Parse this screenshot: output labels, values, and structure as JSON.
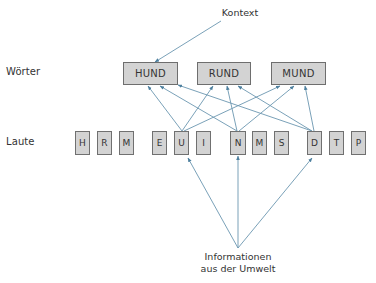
{
  "diagram": {
    "type": "interactive-activation-model",
    "colors": {
      "arrow": "#5b8aa6",
      "box_fill": "#d3d3d3",
      "box_border": "#6e6e6e",
      "text": "#333333"
    },
    "labels": {
      "context": "Kontext",
      "words_row": "Wörter",
      "sounds_row": "Laute",
      "environment_line1": "Informationen",
      "environment_line2": "aus der Umwelt"
    },
    "words": [
      {
        "id": "hund",
        "label": "HUND"
      },
      {
        "id": "rund",
        "label": "RUND"
      },
      {
        "id": "mund",
        "label": "MUND"
      }
    ],
    "sounds": [
      {
        "id": "h",
        "label": "H"
      },
      {
        "id": "r",
        "label": "R"
      },
      {
        "id": "m1",
        "label": "M"
      },
      {
        "id": "e",
        "label": "E"
      },
      {
        "id": "u",
        "label": "U"
      },
      {
        "id": "i",
        "label": "I"
      },
      {
        "id": "n",
        "label": "N"
      },
      {
        "id": "m2",
        "label": "M"
      },
      {
        "id": "s",
        "label": "S"
      },
      {
        "id": "d",
        "label": "D"
      },
      {
        "id": "t",
        "label": "T"
      },
      {
        "id": "p",
        "label": "P"
      }
    ],
    "edges": [
      {
        "from": "Kontext",
        "to": "HUND"
      },
      {
        "from": "U",
        "to": "HUND"
      },
      {
        "from": "U",
        "to": "RUND"
      },
      {
        "from": "U",
        "to": "MUND"
      },
      {
        "from": "N",
        "to": "HUND"
      },
      {
        "from": "N",
        "to": "RUND"
      },
      {
        "from": "N",
        "to": "MUND"
      },
      {
        "from": "D",
        "to": "HUND"
      },
      {
        "from": "D",
        "to": "RUND"
      },
      {
        "from": "D",
        "to": "MUND"
      },
      {
        "from": "Informationen aus der Umwelt",
        "to": "U"
      },
      {
        "from": "Informationen aus der Umwelt",
        "to": "N"
      },
      {
        "from": "Informationen aus der Umwelt",
        "to": "D"
      }
    ]
  }
}
